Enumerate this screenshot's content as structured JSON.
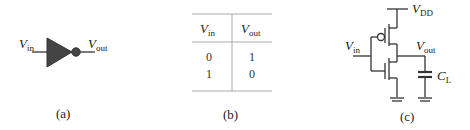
{
  "panel_a": {
    "caption": "(a)",
    "input_label": {
      "main": "V",
      "sub": "in"
    },
    "output_label": {
      "main": "V",
      "sub": "out"
    },
    "symbol": "inverter-not-gate",
    "fill_color": "#444444"
  },
  "panel_b": {
    "caption": "(b)",
    "headers": [
      {
        "main": "V",
        "sub": "in"
      },
      {
        "main": "V",
        "sub": "out"
      }
    ],
    "rows": [
      [
        "0",
        "1"
      ],
      [
        "1",
        "0"
      ]
    ]
  },
  "panel_c": {
    "caption": "(c)",
    "supply_label": {
      "main": "V",
      "sub": "DD"
    },
    "input_label": {
      "main": "V",
      "sub": "in"
    },
    "output_label": {
      "main": "V",
      "sub": "out"
    },
    "load_label": {
      "main": "C",
      "sub": "L"
    },
    "components": [
      "pmos-transistor",
      "nmos-transistor",
      "load-capacitor",
      "ground",
      "ground"
    ]
  }
}
